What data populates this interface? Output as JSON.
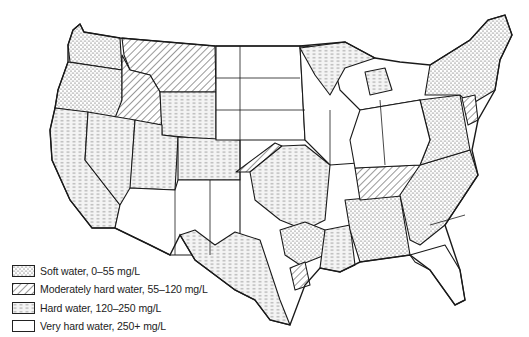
{
  "map": {
    "subject": "United States water hardness map",
    "region_shown": "Contiguous United States",
    "zones": [
      {
        "id": "soft",
        "pattern": "stipple",
        "regions": [
          "Washington",
          "Oregon",
          "New England",
          "New York",
          "Pennsylvania",
          "Virginia",
          "North Carolina",
          "South Carolina",
          "Georgia",
          "Alabama",
          "Mississippi",
          "Arkansas",
          "East Texas"
        ]
      },
      {
        "id": "moderate",
        "pattern": "diagonal-hatch",
        "regions": [
          "Montana",
          "Idaho",
          "Tennessee",
          "New Jersey",
          "Maryland",
          "Kansas strip",
          "Southeast Texas coast"
        ]
      },
      {
        "id": "hard",
        "pattern": "dashed",
        "regions": [
          "California",
          "Nevada",
          "Utah",
          "Colorado",
          "Wyoming",
          "Missouri",
          "Oklahoma east",
          "Louisiana",
          "Central Texas",
          "Upper Michigan",
          "Wisconsin north",
          "Florida panhandle north"
        ]
      },
      {
        "id": "very_hard",
        "pattern": "blank",
        "regions": [
          "Dakotas",
          "Nebraska",
          "Iowa",
          "Illinois",
          "Indiana",
          "Ohio",
          "Arizona",
          "New Mexico",
          "West Texas",
          "Florida"
        ]
      }
    ]
  },
  "legend": {
    "items": [
      {
        "pattern": "stipple",
        "label": "Soft water, 0–55 mg/L"
      },
      {
        "pattern": "hatch",
        "label": "Moderately hard water, 55–120 mg/L"
      },
      {
        "pattern": "dash",
        "label": "Hard water, 120–250 mg/L"
      },
      {
        "pattern": "blank",
        "label": "Very hard water, 250+ mg/L"
      }
    ]
  },
  "colors": {
    "line": "#1a1a1a",
    "background": "#ffffff"
  }
}
